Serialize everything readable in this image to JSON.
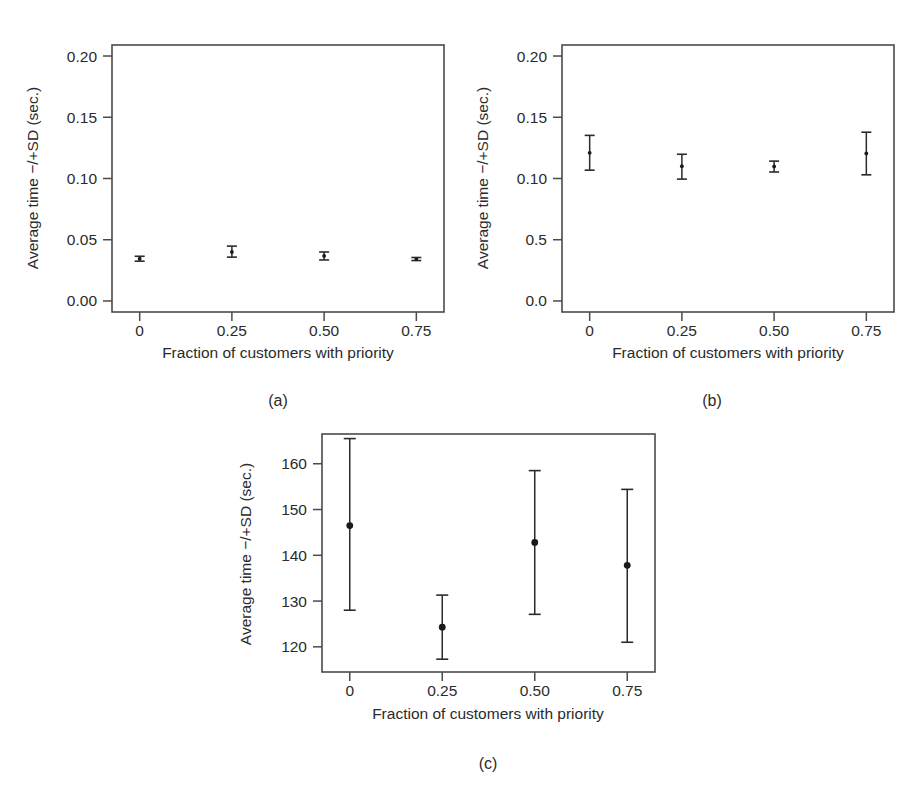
{
  "figure": {
    "caption_a": "(a)",
    "caption_b": "(b)",
    "caption_c": "(c)",
    "background_color": "#ffffff",
    "ink_color": "#2b2b2b"
  },
  "chart_data": [
    {
      "id": "panel-a",
      "type": "scatter",
      "title": "(a)",
      "xlabel": "Fraction of customers with priority",
      "ylabel": "Average time −/+SD (sec.)",
      "x": [
        0,
        0.25,
        0.5,
        0.75
      ],
      "xtick_labels": [
        "0",
        "0.25",
        "0.50",
        "0.75"
      ],
      "ytick_labels": [
        "0.00",
        "0.05",
        "0.10",
        "0.15",
        "0.20"
      ],
      "ytick_values": [
        0.0,
        0.05,
        0.1,
        0.15,
        0.2
      ],
      "xlim": [
        -0.075,
        0.825
      ],
      "ylim": [
        -0.009,
        0.209
      ],
      "grid": false,
      "legend": "none",
      "series": [
        {
          "name": "Average time −/+SD",
          "values": [
            0.0345,
            0.04,
            0.0368,
            0.0342
          ],
          "err_low": [
            0.0325,
            0.0358,
            0.0335,
            0.033
          ],
          "err_high": [
            0.0365,
            0.0448,
            0.04,
            0.0355
          ]
        }
      ]
    },
    {
      "id": "panel-b",
      "type": "scatter",
      "title": "(b)",
      "xlabel": "Fraction of customers with priority",
      "ylabel": "Average time −/+SD (sec.)",
      "x": [
        0,
        0.25,
        0.5,
        0.75
      ],
      "xtick_labels": [
        "0",
        "0.25",
        "0.50",
        "0.75"
      ],
      "ytick_labels": [
        "0.0",
        "0.5",
        "0.10",
        "0.15",
        "0.20"
      ],
      "ytick_values": [
        0.0,
        0.05,
        0.1,
        0.15,
        0.2
      ],
      "xlim": [
        -0.075,
        0.825
      ],
      "ylim": [
        -0.009,
        0.209
      ],
      "grid": false,
      "legend": "none",
      "series": [
        {
          "name": "Average time −/+SD",
          "values": [
            0.121,
            0.11,
            0.1098,
            0.1205
          ],
          "err_low": [
            0.1068,
            0.0995,
            0.1053,
            0.103
          ],
          "err_high": [
            0.1352,
            0.1198,
            0.1142,
            0.1378
          ]
        }
      ]
    },
    {
      "id": "panel-c",
      "type": "scatter",
      "title": "(c)",
      "xlabel": "Fraction of customers with priority",
      "ylabel": "Average time −/+SD (sec.)",
      "x": [
        0,
        0.25,
        0.5,
        0.75
      ],
      "xtick_labels": [
        "0",
        "0.25",
        "0.50",
        "0.75"
      ],
      "ytick_labels": [
        "120",
        "130",
        "140",
        "150",
        "160"
      ],
      "ytick_values": [
        120,
        130,
        140,
        150,
        160
      ],
      "xlim": [
        -0.075,
        0.825
      ],
      "ylim": [
        114.5,
        166.5
      ],
      "grid": false,
      "legend": "none",
      "series": [
        {
          "name": "Average time −/+SD",
          "values": [
            146.5,
            124.3,
            142.8,
            137.8
          ],
          "err_low": [
            128.0,
            117.3,
            127.1,
            121.0
          ],
          "err_high": [
            165.5,
            131.3,
            158.5,
            154.4
          ]
        }
      ]
    }
  ]
}
